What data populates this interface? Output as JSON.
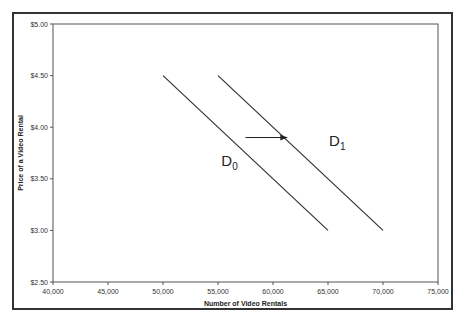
{
  "chart_data": {
    "type": "line",
    "title": "",
    "xlabel": "Number of Video Rentals",
    "ylabel": "Price of a Video Rental",
    "xlim": [
      40000,
      75000
    ],
    "ylim": [
      2.5,
      5.0
    ],
    "x_ticks": [
      40000,
      45000,
      50000,
      55000,
      60000,
      65000,
      70000,
      75000
    ],
    "x_tick_labels": [
      "40,000",
      "45,000",
      "50,000",
      "55,000",
      "60,000",
      "65,000",
      "70,000",
      "75,000"
    ],
    "y_ticks": [
      2.5,
      3.0,
      3.5,
      4.0,
      4.5,
      5.0
    ],
    "y_tick_labels": [
      "$2.50",
      "$3.00",
      "$3.50",
      "$4.00",
      "$4.50",
      "$5.00"
    ],
    "grid": false,
    "legend": "none",
    "series": [
      {
        "name": "D0",
        "label_main": "D",
        "label_sub": "0",
        "x": [
          50000,
          65000
        ],
        "y": [
          4.5,
          3.0
        ]
      },
      {
        "name": "D1",
        "label_main": "D",
        "label_sub": "1",
        "x": [
          55000,
          70000
        ],
        "y": [
          4.5,
          3.0
        ]
      }
    ],
    "annotations": [
      {
        "type": "arrow",
        "from": [
          57500,
          3.9
        ],
        "to": [
          61300,
          3.9
        ],
        "meaning": "shift of demand from D0 to D1"
      }
    ]
  }
}
